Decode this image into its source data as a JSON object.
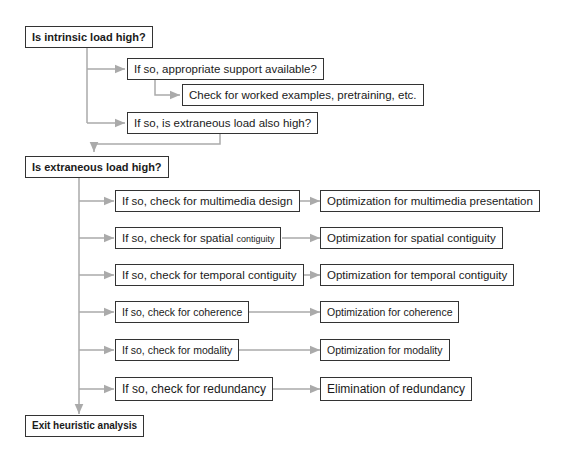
{
  "diagram": {
    "nodes": {
      "intrinsic": "Is intrinsic load high?",
      "support": "If so, appropriate support available?",
      "worked": "Check for worked examples, pretraining, etc.",
      "extraneous_also": "If so, is extraneous load also high?",
      "extraneous": "Is extraneous load high?",
      "check_multimedia": "If so, check for multimedia design",
      "opt_multimedia": "Optimization for multimedia presentation",
      "check_spatial_a": "If so, check for spatial ",
      "check_spatial_b": "contiguity",
      "opt_spatial": "Optimization for spatial contiguity",
      "check_temporal": "If so, check for temporal contiguity",
      "opt_temporal": "Optimization for temporal contiguity",
      "check_coherence": "If so, check for coherence",
      "opt_coherence": "Optimization for coherence",
      "check_modality": "If so, check for modality",
      "opt_modality": "Optimization for modality",
      "check_redundancy": "If so, check for redundancy",
      "elim_redundancy": "Elimination of redundancy",
      "exit": "Exit heuristic analysis"
    },
    "colors": {
      "border": "#333333",
      "connector": "#aaaaaa"
    }
  }
}
